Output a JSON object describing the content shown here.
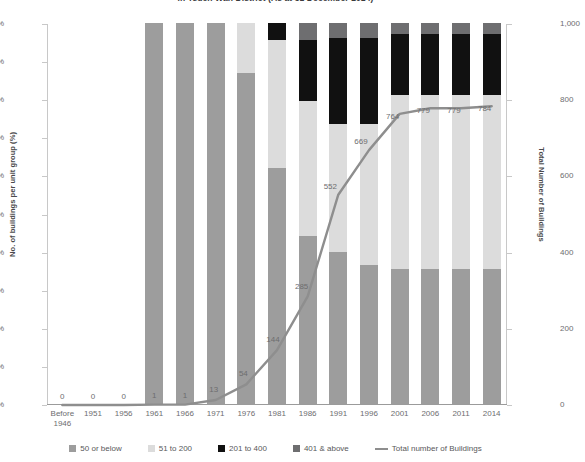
{
  "title": "in Tsuen Wan District (As at 31 December 2014)",
  "axes": {
    "left_title": "No. of buildings per unit group (%)",
    "right_title": "Total Number of Buildings",
    "left_ticks": [
      "0%",
      "10%",
      "20%",
      "30%",
      "40%",
      "50%",
      "60%",
      "70%",
      "80%",
      "90%",
      "100%"
    ],
    "right_ticks": [
      "0",
      "200",
      "400",
      "600",
      "800",
      "1,000"
    ]
  },
  "legend": [
    {
      "label": "50 or below",
      "color": "#9d9d9d",
      "type": "swatch"
    },
    {
      "label": "51 to 200",
      "color": "#dcdcdc",
      "type": "swatch"
    },
    {
      "label": "201 to 400",
      "color": "#111111",
      "type": "swatch"
    },
    {
      "label": "401 & above",
      "color": "#6e6e70",
      "type": "swatch"
    },
    {
      "label": "Total number of Buildings",
      "color": "#8e8e8e",
      "type": "line"
    }
  ],
  "chart_data": {
    "type": "bar",
    "title": "in Tsuen Wan District (As at 31 December 2014)",
    "xlabel": "",
    "ylabel": "No. of buildings per unit group (%)",
    "y2label": "Total Number of Buildings",
    "ylim": [
      0,
      100
    ],
    "y2lim": [
      0,
      1000
    ],
    "grid": false,
    "legend_position": "bottom",
    "categories": [
      "Before 1946",
      "1951",
      "1956",
      "1961",
      "1966",
      "1971",
      "1976",
      "1981",
      "1986",
      "1991",
      "1996",
      "2001",
      "2006",
      "2011",
      "2014"
    ],
    "series": [
      {
        "name": "50 or below",
        "values": [
          0,
          0,
          0,
          100,
          100,
          100,
          87.0,
          62.0,
          44.0,
          40.0,
          36.5,
          35.5,
          35.5,
          35.5,
          35.5
        ]
      },
      {
        "name": "51 to 200",
        "values": [
          0,
          0,
          0,
          0,
          0,
          0,
          13.0,
          33.5,
          35.5,
          33.5,
          37.0,
          45.5,
          45.5,
          45.5,
          45.5
        ]
      },
      {
        "name": "201 to 400",
        "values": [
          0,
          0,
          0,
          0,
          0,
          0,
          0,
          4.5,
          16.0,
          22.5,
          22.5,
          16.0,
          16.0,
          16.0,
          16.0
        ]
      },
      {
        "name": "401 & above",
        "values": [
          0,
          0,
          0,
          0,
          0,
          0,
          0,
          0,
          4.5,
          4.0,
          4.0,
          3.0,
          3.0,
          3.0,
          3.0
        ]
      }
    ],
    "line_series": {
      "name": "Total number of Buildings",
      "values": [
        0,
        0,
        0,
        1,
        1,
        13,
        54,
        144,
        285,
        552,
        669,
        764,
        779,
        779,
        784
      ],
      "labels": [
        "0",
        "0",
        "0",
        "1",
        "1",
        "13",
        "54",
        "144",
        "285",
        "552",
        "669",
        "764",
        "779",
        "779",
        "784"
      ]
    }
  }
}
